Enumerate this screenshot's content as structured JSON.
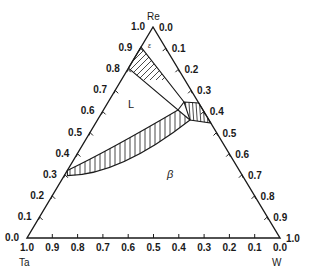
{
  "chart_data": {
    "type": "ternary_phase_diagram",
    "title": "",
    "components": {
      "top": "Re",
      "bottom_left": "Ta",
      "bottom_right": "W"
    },
    "axes": {
      "left_edge": {
        "ticks": [
          "0.0",
          "0.1",
          "0.2",
          "0.3",
          "0.4",
          "0.5",
          "0.6",
          "0.7",
          "0.8",
          "0.9",
          "1.0"
        ],
        "direction": "Ta (bottom, 0.0) to Re (top, 1.0)"
      },
      "right_edge": {
        "ticks": [
          "0.0",
          "0.1",
          "0.2",
          "0.3",
          "0.4",
          "0.5",
          "0.6",
          "0.7",
          "0.8",
          "0.9",
          "1.0"
        ],
        "direction": "Re (top, 0.0) to W (bottom, 1.0)"
      },
      "bottom_edge": {
        "ticks": [
          "1.0",
          "0.9",
          "0.8",
          "0.7",
          "0.6",
          "0.5",
          "0.4",
          "0.3",
          "0.2",
          "0.1",
          "0.0"
        ],
        "direction": "Ta (left, 1.0) to W (right, 0.0)"
      }
    },
    "phase_labels": [
      {
        "label": "L",
        "region": "liquid, upper-left interior"
      },
      {
        "label": "β",
        "region": "lower interior"
      },
      {
        "label": "ε",
        "region": "near Re apex"
      }
    ],
    "regions": [
      {
        "name": "upper two-phase band",
        "hatched": true,
        "from_left_edge_Re": [
          0.8,
          0.9
        ],
        "to": "three-phase triangle"
      },
      {
        "name": "three-phase triangle",
        "hatched": true,
        "touches_right_edge_Re_to_W": [
          0.35,
          0.45
        ]
      },
      {
        "name": "lower two-phase band",
        "hatched": true,
        "from_left_edge_Re": [
          0.3,
          0.32
        ],
        "to": "three-phase triangle",
        "shape": "curved"
      }
    ],
    "grid": false,
    "legend": null
  },
  "labels": {
    "top_vertex": "Re",
    "left_vertex": "Ta",
    "right_vertex": "W",
    "phase_L": "L",
    "phase_beta": "β",
    "phase_eps": "ε",
    "left_ticks": [
      "0.0",
      "0.1",
      "0.2",
      "0.3",
      "0.4",
      "0.5",
      "0.6",
      "0.7",
      "0.8",
      "0.9",
      "1.0"
    ],
    "right_ticks": [
      "0.0",
      "0.1",
      "0.2",
      "0.3",
      "0.4",
      "0.5",
      "0.6",
      "0.7",
      "0.8",
      "0.9",
      "1.0"
    ],
    "bottom_ticks": [
      "1.0",
      "0.9",
      "0.8",
      "0.7",
      "0.6",
      "0.5",
      "0.4",
      "0.3",
      "0.2",
      "0.1",
      "0.0"
    ]
  },
  "colors": {
    "line": "#1a1a1a",
    "background": "#ffffff"
  }
}
